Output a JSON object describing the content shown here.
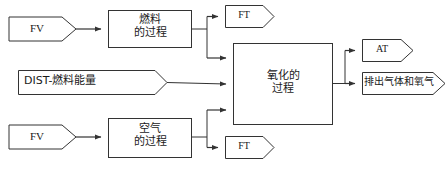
{
  "diagram": {
    "canvas": {
      "width": 446,
      "height": 173
    },
    "colors": {
      "stroke": "#333333",
      "text": "#1a1a1a",
      "background": "#ffffff"
    },
    "nodes": [
      {
        "id": "fv-fuel",
        "shape": "pentagon-arrow",
        "label": "FV",
        "script": "latin",
        "x": 8,
        "y": 16,
        "width": 68,
        "height": 26,
        "font_size": 11
      },
      {
        "id": "fuel-process",
        "shape": "rectangle",
        "label": "燃料\n的过程",
        "script": "cjk",
        "x": 108,
        "y": 10,
        "width": 84,
        "height": 38,
        "font_size": 11
      },
      {
        "id": "ft-top",
        "shape": "pentagon-arrow",
        "label": "FT",
        "script": "latin",
        "x": 225,
        "y": 5,
        "width": 50,
        "height": 22,
        "font_size": 10
      },
      {
        "id": "dist-fuel-energy",
        "shape": "pentagon-arrow",
        "label": "DIST-燃料能量",
        "script": "cjk",
        "x": 18,
        "y": 70,
        "width": 150,
        "height": 24,
        "font_size": 11
      },
      {
        "id": "oxidation-process",
        "shape": "rectangle",
        "label": "氧化的\n过程",
        "script": "cjk",
        "x": 233,
        "y": 43,
        "width": 100,
        "height": 82,
        "font_size": 11
      },
      {
        "id": "at-output",
        "shape": "pentagon-arrow",
        "label": "AT",
        "script": "latin",
        "x": 362,
        "y": 39,
        "width": 52,
        "height": 22,
        "font_size": 10
      },
      {
        "id": "exhaust-output",
        "shape": "pentagon-arrow",
        "label": "排出气体和氧气",
        "script": "cjk",
        "x": 362,
        "y": 72,
        "width": 84,
        "height": 22,
        "font_size": 10
      },
      {
        "id": "fv-air",
        "shape": "pentagon-arrow",
        "label": "FV",
        "script": "latin",
        "x": 8,
        "y": 124,
        "width": 68,
        "height": 26,
        "font_size": 11
      },
      {
        "id": "air-process",
        "shape": "rectangle",
        "label": "空气\n的过程",
        "script": "cjk",
        "x": 108,
        "y": 118,
        "width": 84,
        "height": 40,
        "font_size": 11
      },
      {
        "id": "ft-bottom",
        "shape": "pentagon-arrow",
        "label": "FT",
        "script": "latin",
        "x": 225,
        "y": 136,
        "width": 50,
        "height": 22,
        "font_size": 10
      }
    ],
    "connectors": [
      {
        "id": "fv-fuel-to-fuel-process",
        "from": "fv-fuel",
        "to": "fuel-process",
        "arrow": true
      },
      {
        "id": "fuel-process-to-ft-top",
        "from": "fuel-process",
        "to": "ft-top",
        "arrow": true
      },
      {
        "id": "fuel-process-to-oxidation",
        "from": "fuel-process",
        "to": "oxidation-process",
        "arrow": true
      },
      {
        "id": "dist-to-oxidation",
        "from": "dist-fuel-energy",
        "to": "oxidation-process",
        "arrow": true
      },
      {
        "id": "air-process-to-oxidation",
        "from": "air-process",
        "to": "oxidation-process",
        "arrow": true
      },
      {
        "id": "air-process-to-ft-bottom",
        "from": "air-process",
        "to": "ft-bottom",
        "arrow": true
      },
      {
        "id": "fv-air-to-air-process",
        "from": "fv-air",
        "to": "air-process",
        "arrow": true
      },
      {
        "id": "oxidation-to-at",
        "from": "oxidation-process",
        "to": "at-output",
        "arrow": true
      },
      {
        "id": "oxidation-to-exhaust",
        "from": "oxidation-process",
        "to": "exhaust-output",
        "arrow": true
      }
    ]
  }
}
